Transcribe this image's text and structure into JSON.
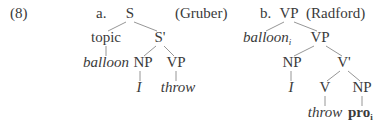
{
  "example_number": "(8)",
  "trees": [
    {
      "label": "a.",
      "source": "(Gruber)",
      "nodes": {
        "root": "S",
        "topic": "topic",
        "sbar": "S'",
        "topic_word": "balloon",
        "np": "NP",
        "vp": "VP",
        "np_word": "I",
        "vp_word": "throw"
      }
    },
    {
      "label": "b.",
      "source": "(Radford)",
      "nodes": {
        "root": "VP",
        "spec_word": "balloon",
        "spec_subscript": "i",
        "vp": "VP",
        "np": "NP",
        "vbar": "V'",
        "np_word": "I",
        "v": "V",
        "obj_np": "NP",
        "v_word": "throw",
        "obj_word": "pro",
        "obj_subscript": "i"
      }
    }
  ]
}
